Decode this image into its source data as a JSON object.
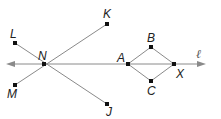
{
  "diagram": {
    "line_label": "ℓ",
    "points": {
      "N": {
        "label": "N",
        "x": 44,
        "y": 64
      },
      "K": {
        "label": "K",
        "x": 107,
        "y": 24
      },
      "J": {
        "label": "J",
        "x": 107,
        "y": 104
      },
      "L": {
        "label": "L",
        "x": 15,
        "y": 43
      },
      "M": {
        "label": "M",
        "x": 15,
        "y": 85
      },
      "A": {
        "label": "A",
        "x": 128,
        "y": 64
      },
      "B": {
        "label": "B",
        "x": 151,
        "y": 47
      },
      "C": {
        "label": "C",
        "x": 151,
        "y": 81
      },
      "X": {
        "label": "X",
        "x": 174,
        "y": 64
      }
    },
    "colors": {
      "line": "#888888",
      "point": "#111111",
      "text": "#222222"
    }
  }
}
